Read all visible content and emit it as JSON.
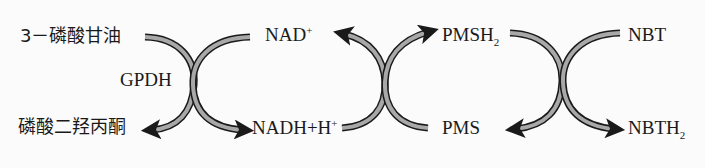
{
  "diagram": {
    "type": "coupled-redox-reaction-scheme",
    "colors": {
      "arrow_fill": "#a8a8a8",
      "arrow_stroke": "#1a1a1a",
      "text": "#1a1a1a"
    },
    "reaction1": {
      "substrate": "3－磷酸甘油",
      "enzyme": "GPDH",
      "product": "磷酸二羟丙酮",
      "cofactor_in": {
        "base": "NAD",
        "sup": "+"
      },
      "cofactor_out": {
        "base": "NADH+H",
        "sup": "+"
      }
    },
    "reaction2": {
      "reduced": {
        "base": "PMSH",
        "sub": "2"
      },
      "oxidized": "PMS"
    },
    "reaction3": {
      "substrate": "NBT",
      "product": {
        "base": "NBTH",
        "sub": "2"
      }
    }
  }
}
